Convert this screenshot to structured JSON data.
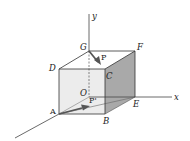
{
  "diagram": {
    "type": "3d-cube-force-diagram",
    "axes": {
      "x_label": "x",
      "y_label": "y",
      "z_label": ""
    },
    "vertices": {
      "A": "A",
      "B": "B",
      "C": "C",
      "D": "D",
      "E": "E",
      "F": "F",
      "G": "G",
      "O": "O"
    },
    "forces": {
      "P": "P",
      "P_prime": "P'"
    },
    "colors": {
      "front_face": "#eeeeee",
      "right_face": "#a8a8a8",
      "edges": "#333333",
      "arrow": "#555555"
    }
  }
}
